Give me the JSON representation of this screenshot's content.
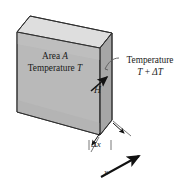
{
  "figure": {
    "name": "heat-conduction-slab-diagram",
    "background_color": "#ffffff",
    "line_color": "#1a1a1a",
    "colors": {
      "front_face": "#b9b9b9",
      "top_face": "#dcdcdc",
      "side_face": "#a5a5a5",
      "outline": "#3a3a3a",
      "text": "#1a1a1a"
    }
  },
  "labels": {
    "area": "Area ",
    "area_symbol": "A",
    "temperature": "Temperature ",
    "temperature_symbol": "T",
    "temperature_right_line1": "Temperature",
    "temperature_right_line2_base": "T",
    "temperature_right_line2_plus": " + ",
    "temperature_right_line2_delta": "ΔT",
    "heat_flow_symbol": "H",
    "thickness_delta": "Δ",
    "thickness_symbol": "x",
    "axis_symbol": "x"
  },
  "geometry": {
    "front_face_points": "17,32 100,48 100,135 17,112",
    "top_face_points": "17,32 30,16 112,33 100,48",
    "side_face_points": "100,48 112,33 112,120 100,135",
    "heat_arrow": {
      "x1": 92,
      "y1": 90,
      "x2": 108,
      "y2": 76
    },
    "leader_line": {
      "from_x": 116,
      "from_y": 60,
      "to_x": 103,
      "to_y": 70
    },
    "dim_left_tick_x": 92,
    "dim_right_tick_x": 118,
    "dim_line_y": 146,
    "axis_arrow": {
      "x1": 103,
      "y1": 176,
      "x2": 140,
      "y2": 156
    }
  }
}
